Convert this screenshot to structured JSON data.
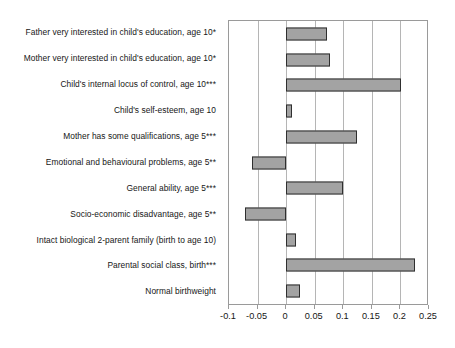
{
  "chart_data": {
    "type": "bar",
    "orientation": "horizontal",
    "title": "",
    "subtitle": "",
    "xlabel": "",
    "ylabel": "",
    "xlim": [
      -0.1,
      0.25
    ],
    "xticks": [
      -0.1,
      -0.05,
      0,
      0.05,
      0.1,
      0.15,
      0.2,
      0.25
    ],
    "xtick_labels": [
      "-0.1",
      "-0.05",
      "0",
      "0.05",
      "0.1",
      "0.15",
      "0.2",
      "0.25"
    ],
    "grid": "vertical",
    "legend": "none",
    "bar_color": "#a3a3a3",
    "bar_edge_color": "#2f2f2f",
    "categories": [
      "Father very interested in child's education, age 10*",
      "Mother very interested in child's education, age 10*",
      "Child's internal locus of control, age 10***",
      "Child's self-esteem, age 10",
      "Mother has some qualifications, age 5***",
      "Emotional and behavioural problems, age 5**",
      "General ability, age 5***",
      "Socio-economic disadvantage, age 5**",
      "Intact biological 2-parent family (birth to age 10)",
      "Parental social class, birth***",
      "Normal birthweight"
    ],
    "values": [
      0.072,
      0.077,
      0.201,
      0.01,
      0.124,
      -0.059,
      0.1,
      -0.072,
      0.017,
      0.226,
      0.024
    ]
  }
}
